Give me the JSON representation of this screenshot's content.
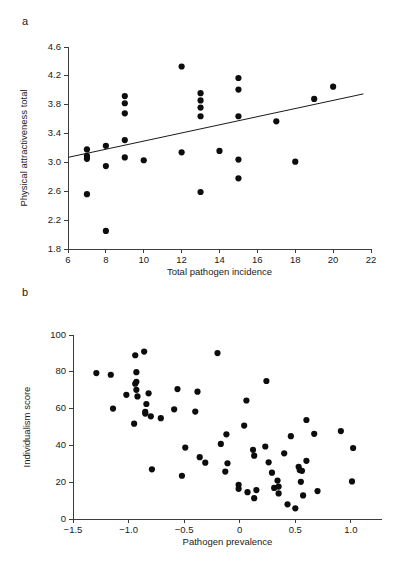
{
  "figure": {
    "panel_a_label": "a",
    "panel_b_label": "b"
  },
  "chart_data": [
    {
      "type": "scatter",
      "panel": "a",
      "title": "",
      "xlabel": "Total pathogen incidence",
      "ylabel": "Physical attractiveness total",
      "xlim": [
        6,
        22
      ],
      "ylim": [
        1.8,
        4.6
      ],
      "xticks": [
        6,
        8,
        10,
        12,
        14,
        16,
        18,
        20,
        22
      ],
      "xticklabels": [
        "6",
        "8",
        "10",
        "12",
        "14",
        "16",
        "18",
        "20",
        "22"
      ],
      "yticks": [
        1.8,
        2.2,
        2.6,
        3.0,
        3.4,
        3.8,
        4.2,
        4.6
      ],
      "yticklabels": [
        "1.8",
        "2.2",
        "2.6",
        "3.0",
        "3.4",
        "3.8",
        "4.2",
        "4.6"
      ],
      "grid": false,
      "legend": "none",
      "marker_size": 3.1,
      "marker_color": "#0d0d0d",
      "trendline": {
        "visible": true,
        "x0": 6.0,
        "y0": 3.07,
        "x1": 21.6,
        "y1": 3.95,
        "color": "#1a1a1a"
      },
      "points": [
        {
          "x": 7.0,
          "y": 3.18
        },
        {
          "x": 7.0,
          "y": 3.09
        },
        {
          "x": 7.0,
          "y": 3.05
        },
        {
          "x": 7.0,
          "y": 2.56
        },
        {
          "x": 8.0,
          "y": 3.23
        },
        {
          "x": 8.0,
          "y": 2.95
        },
        {
          "x": 8.0,
          "y": 2.05
        },
        {
          "x": 9.0,
          "y": 3.92
        },
        {
          "x": 9.0,
          "y": 3.82
        },
        {
          "x": 9.0,
          "y": 3.68
        },
        {
          "x": 9.0,
          "y": 3.31
        },
        {
          "x": 9.0,
          "y": 3.07
        },
        {
          "x": 10.0,
          "y": 3.03
        },
        {
          "x": 12.0,
          "y": 4.33
        },
        {
          "x": 12.0,
          "y": 3.14
        },
        {
          "x": 13.0,
          "y": 3.96
        },
        {
          "x": 13.0,
          "y": 3.86
        },
        {
          "x": 13.0,
          "y": 3.76
        },
        {
          "x": 13.0,
          "y": 3.64
        },
        {
          "x": 13.0,
          "y": 2.59
        },
        {
          "x": 14.0,
          "y": 3.16
        },
        {
          "x": 15.0,
          "y": 4.17
        },
        {
          "x": 15.0,
          "y": 4.01
        },
        {
          "x": 15.0,
          "y": 3.64
        },
        {
          "x": 15.0,
          "y": 3.04
        },
        {
          "x": 15.0,
          "y": 2.78
        },
        {
          "x": 17.0,
          "y": 3.57
        },
        {
          "x": 18.0,
          "y": 3.01
        },
        {
          "x": 19.0,
          "y": 3.88
        },
        {
          "x": 20.0,
          "y": 4.05
        }
      ]
    },
    {
      "type": "scatter",
      "panel": "b",
      "title": "",
      "xlabel": "Pathogen prevalence",
      "ylabel": "Individualism score",
      "xlim": [
        -1.5,
        1.28
      ],
      "ylim": [
        0,
        100
      ],
      "xticks": [
        -1.5,
        -1.0,
        -0.5,
        0,
        0.5,
        1.0
      ],
      "xticklabels": [
        "−1.5",
        "−1.0",
        "−0.5",
        "0",
        "0.5",
        "1.0"
      ],
      "yticks": [
        0,
        20,
        40,
        60,
        80,
        100
      ],
      "yticklabels": [
        "0",
        "20",
        "40",
        "60",
        "80",
        "100"
      ],
      "grid": false,
      "legend": "none",
      "marker_size": 3.1,
      "marker_color": "#0d0d0d",
      "trendline": {
        "visible": false
      },
      "points": [
        {
          "x": -1.29,
          "y": 79.3
        },
        {
          "x": -1.16,
          "y": 78.4
        },
        {
          "x": -1.14,
          "y": 60.0
        },
        {
          "x": -1.02,
          "y": 67.5
        },
        {
          "x": -0.94,
          "y": 89.0
        },
        {
          "x": -0.93,
          "y": 79.8
        },
        {
          "x": -0.93,
          "y": 74.6
        },
        {
          "x": -0.94,
          "y": 73.5
        },
        {
          "x": -0.93,
          "y": 70.2
        },
        {
          "x": -0.92,
          "y": 66.6
        },
        {
          "x": -0.95,
          "y": 51.8
        },
        {
          "x": -0.86,
          "y": 91.0
        },
        {
          "x": -0.82,
          "y": 68.3
        },
        {
          "x": -0.84,
          "y": 62.5
        },
        {
          "x": -0.85,
          "y": 58.2
        },
        {
          "x": -0.85,
          "y": 57.3
        },
        {
          "x": -0.8,
          "y": 55.8
        },
        {
          "x": -0.79,
          "y": 27.0
        },
        {
          "x": -0.71,
          "y": 54.8
        },
        {
          "x": -0.56,
          "y": 70.6
        },
        {
          "x": -0.59,
          "y": 59.6
        },
        {
          "x": -0.52,
          "y": 23.5
        },
        {
          "x": -0.49,
          "y": 38.8
        },
        {
          "x": -0.38,
          "y": 69.2
        },
        {
          "x": -0.4,
          "y": 58.4
        },
        {
          "x": -0.36,
          "y": 33.6
        },
        {
          "x": -0.31,
          "y": 30.6
        },
        {
          "x": -0.2,
          "y": 90.2
        },
        {
          "x": -0.17,
          "y": 40.8
        },
        {
          "x": -0.12,
          "y": 46.0
        },
        {
          "x": -0.11,
          "y": 30.3
        },
        {
          "x": -0.13,
          "y": 25.8
        },
        {
          "x": -0.01,
          "y": 18.6
        },
        {
          "x": -0.01,
          "y": 16.4
        },
        {
          "x": 0.06,
          "y": 64.4
        },
        {
          "x": 0.04,
          "y": 50.8
        },
        {
          "x": 0.07,
          "y": 14.6
        },
        {
          "x": 0.12,
          "y": 37.6
        },
        {
          "x": 0.13,
          "y": 34.4
        },
        {
          "x": 0.13,
          "y": 11.3
        },
        {
          "x": 0.15,
          "y": 15.7
        },
        {
          "x": 0.24,
          "y": 75.0
        },
        {
          "x": 0.23,
          "y": 39.4
        },
        {
          "x": 0.26,
          "y": 30.8
        },
        {
          "x": 0.29,
          "y": 25.2
        },
        {
          "x": 0.31,
          "y": 16.9
        },
        {
          "x": 0.34,
          "y": 20.9
        },
        {
          "x": 0.35,
          "y": 17.6
        },
        {
          "x": 0.35,
          "y": 13.9
        },
        {
          "x": 0.4,
          "y": 35.7
        },
        {
          "x": 0.43,
          "y": 8.0
        },
        {
          "x": 0.46,
          "y": 45.0
        },
        {
          "x": 0.5,
          "y": 5.8
        },
        {
          "x": 0.53,
          "y": 28.4
        },
        {
          "x": 0.54,
          "y": 26.6
        },
        {
          "x": 0.56,
          "y": 26.2
        },
        {
          "x": 0.55,
          "y": 20.2
        },
        {
          "x": 0.57,
          "y": 12.8
        },
        {
          "x": 0.6,
          "y": 53.8
        },
        {
          "x": 0.6,
          "y": 31.6
        },
        {
          "x": 0.67,
          "y": 46.3
        },
        {
          "x": 0.7,
          "y": 15.2
        },
        {
          "x": 0.91,
          "y": 47.8
        },
        {
          "x": 1.02,
          "y": 38.6
        },
        {
          "x": 1.01,
          "y": 20.4
        }
      ]
    }
  ]
}
